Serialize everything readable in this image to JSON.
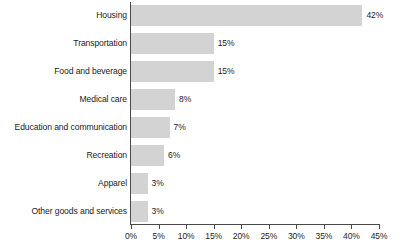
{
  "chart_data": {
    "type": "bar",
    "orientation": "horizontal",
    "title": "",
    "subtitle": "",
    "xlabel": "",
    "ylabel": "",
    "xlim": [
      0,
      45
    ],
    "grid": false,
    "legend": false,
    "categories": [
      "Housing",
      "Transportation",
      "Food and beverage",
      "Medical care",
      "Education and communication",
      "Recreation",
      "Apparel",
      "Other goods and services"
    ],
    "values": [
      42,
      15,
      15,
      8,
      7,
      6,
      3,
      3
    ],
    "value_labels": [
      "42%",
      "15%",
      "15%",
      "8%",
      "7%",
      "6%",
      "3%",
      "3%"
    ],
    "xticks": [
      0,
      5,
      10,
      15,
      20,
      25,
      30,
      35,
      40,
      45
    ],
    "xtick_labels": [
      "0%",
      "5%",
      "10%",
      "15%",
      "20%",
      "25%",
      "30%",
      "35%",
      "40%",
      "45%"
    ],
    "bar_color": "#d3d3d3",
    "axis_color": "#4a4a4a",
    "text_color": "#1c1c1c"
  }
}
